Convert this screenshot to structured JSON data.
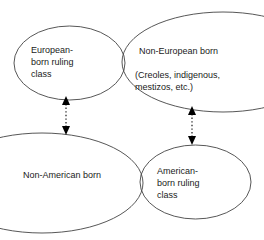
{
  "diagram": {
    "type": "venn-diagram",
    "background_color": "#ffffff",
    "stroke_color": "#444444",
    "text_color": "#1a1a1a",
    "groups": [
      {
        "id": "top",
        "ellipses": [
          {
            "name": "european-born-ruling-class",
            "label": "European-\nborn ruling\nclass"
          },
          {
            "name": "non-european-born",
            "label": "Non-European born",
            "detail": "(Creoles, indigenous,\nmestizos, etc.)"
          }
        ]
      },
      {
        "id": "bottom",
        "ellipses": [
          {
            "name": "non-american-born",
            "label": "Non-American born"
          },
          {
            "name": "american-born-ruling-class",
            "label": "American-\nborn ruling\nclass"
          }
        ]
      }
    ],
    "connectors": [
      {
        "name": "left-connector",
        "style": "dotted",
        "heads": "both",
        "orientation": "vertical"
      },
      {
        "name": "right-connector",
        "style": "dotted",
        "heads": "both",
        "orientation": "vertical"
      }
    ]
  }
}
